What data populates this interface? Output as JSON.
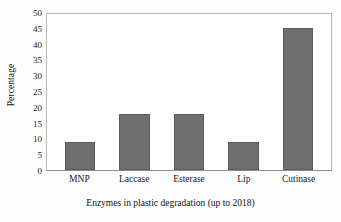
{
  "chart_data": {
    "type": "bar",
    "title": "",
    "xlabel": "Enzymes in plastic degradation (up to 2018)",
    "ylabel": "Percentage",
    "categories": [
      "MNP",
      "Laccase",
      "Esterase",
      "Lip",
      "Cutinase"
    ],
    "values": [
      9,
      18,
      18,
      9,
      45.5
    ],
    "ylim": [
      0,
      50
    ],
    "ytick_step": 5,
    "yticks": [
      50,
      45,
      40,
      35,
      30,
      25,
      20,
      15,
      10,
      5,
      0
    ],
    "grid": false,
    "legend": false,
    "series": [
      {
        "name": "Percentage",
        "values": [
          9,
          18,
          18,
          9,
          45.5
        ]
      }
    ],
    "colors": {
      "bar_fill": "#706F6F",
      "bar_edge": "#5A5A5A",
      "plot_border": "#B9B9B9",
      "axis_line": "#8D8D8D",
      "text": "#1A1A1A",
      "background": "#FDFDFD"
    }
  }
}
